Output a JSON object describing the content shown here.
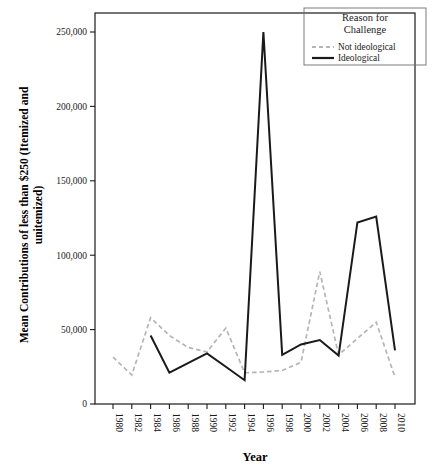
{
  "chart_data": {
    "type": "line",
    "title": "",
    "xlabel": "Year",
    "ylabel": "Mean Contributions of less than $250 (Itemized and unitemized)",
    "ylabel_line1": "Mean Contributions of less than $250 (Itemized and",
    "ylabel_line2": "unitemized)",
    "x": [
      1980,
      1982,
      1984,
      1986,
      1988,
      1990,
      1992,
      1994,
      1996,
      1998,
      2000,
      2002,
      2004,
      2006,
      2008,
      2010
    ],
    "xtick_labels": [
      "1980",
      "1982",
      "1984",
      "1986",
      "1988",
      "1990",
      "1992",
      "1994",
      "1996",
      "1998",
      "2000",
      "2002",
      "2004",
      "2006",
      "2008",
      "2010"
    ],
    "xlim": [
      1979,
      2011
    ],
    "ylim": [
      0,
      265000
    ],
    "ytick_values": [
      0,
      50000,
      100000,
      150000,
      200000,
      250000
    ],
    "ytick_labels": [
      "0",
      "50,000",
      "100,000",
      "150,000",
      "200,000",
      "250,000"
    ],
    "grid": false,
    "legend_position": "top-right",
    "legend_title_line1": "Reason for",
    "legend_title_line2": "Challenge",
    "series": [
      {
        "name": "Not ideological",
        "style": "dashed",
        "color": "#b5b5b5",
        "x": [
          1980,
          1982,
          1984,
          1986,
          1988,
          1990,
          1992,
          1994,
          1996,
          1998,
          2000,
          2002,
          2004,
          2006,
          2008,
          2010
        ],
        "values": [
          31500,
          19500,
          58000,
          46000,
          38000,
          35000,
          51000,
          21000,
          21500,
          22500,
          28000,
          89000,
          33000,
          44000,
          55000,
          18000
        ]
      },
      {
        "name": "Ideological",
        "style": "solid",
        "color": "#1a1a1a",
        "x": [
          1984,
          1986,
          1990,
          1992,
          1994,
          1996,
          1998,
          2000,
          2002,
          2004,
          2006,
          2008,
          2010
        ],
        "values": [
          46000,
          21000,
          34000,
          25000,
          16000,
          250000,
          33000,
          40000,
          43000,
          32500,
          122000,
          126000,
          36000
        ]
      }
    ],
    "legend_entries": [
      {
        "label": "Not ideological",
        "style": "dashed",
        "color": "#b5b5b5"
      },
      {
        "label": "Ideological",
        "style": "solid",
        "color": "#1a1a1a"
      }
    ]
  }
}
